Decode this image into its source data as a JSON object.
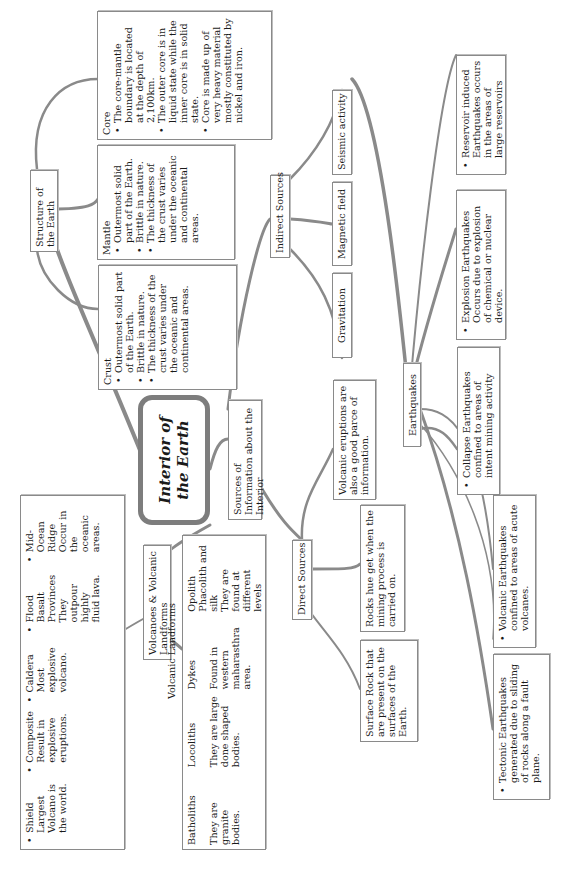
{
  "title": "Interior of the Earth",
  "structure": {
    "label": "Structure of the Earth",
    "crust": {
      "heading": "Crust",
      "points": [
        "Outermost solid part of the Earth.",
        "Brittle in nature.",
        "The thickness of the crust varies under the oceanic and continental areas."
      ]
    },
    "mantle": {
      "heading": "Mantle",
      "points": [
        "Outermost solid part of the Earth.",
        "Brittle in nature.",
        "The thickness of the crust varies under the oceanic and continental areas."
      ]
    },
    "core": {
      "heading": "Core",
      "points": [
        "The core-mantle boundary is located at the depth of 2,100km.",
        "The outer core is in liquid state while the inner core is in solid state.",
        "Core is made up of very heavy material mostly constituted by nickel and iron."
      ]
    }
  },
  "sources": {
    "label": "Sources of Information about the Interior",
    "indirect": {
      "label": "Indirect Sources",
      "items": [
        "Gravitation",
        "Magnetic field",
        "Seismic activity"
      ]
    },
    "direct": {
      "label": "Direct Sources",
      "items": [
        "Surface Rock that are present on the surfaces of the Earth.",
        "Rocks hue get when the mining process is carried on.",
        "Volcanic eruptions are also a good parce of information."
      ]
    }
  },
  "earthquakes": {
    "label": "Earthquakes",
    "types": [
      "Tectonic Earthquakes generated due to sliding of rocks along a fault plane.",
      "Volcanic Earthquakes confined to areas of acute volcanes.",
      "Collapse Earthquakes confined to areas of intent mining activity",
      "Explosion Earthquakes Occurs due to explosion of chemical or nuclear device.",
      "Reservoir induced Earthquakes occurs in the areas of large reservoirs"
    ]
  },
  "volcanoes": {
    "label": "Volcanoes & Volcanic Landforms",
    "types_label": "Types of Volcanes",
    "landforms_label": "Volcanic Landforms",
    "types": [
      {
        "name": "Shield",
        "desc": "Largest Volcano is the world."
      },
      {
        "name": "Composite",
        "desc": "Result in explosive eruptions."
      },
      {
        "name": "Caldera",
        "desc": "Most explosive volcano."
      },
      {
        "name": "Flood Basalt Provinces",
        "desc": "They outpour highly fluid lava."
      },
      {
        "name": "Mid-Ocean Ridge",
        "desc": "Occur in the oceanic areas."
      }
    ],
    "landforms": [
      {
        "name": "Batholiths",
        "desc": "They are granite bodies."
      },
      {
        "name": "Locoliths",
        "desc": "They are large done shaped bodies."
      },
      {
        "name": "Dykes",
        "desc": "Found in western maharasthra area."
      },
      {
        "name": "Opolith Phacolith and silk",
        "desc": "They are found at different levels"
      }
    ]
  },
  "colors": {
    "stroke": "#8a8a8a",
    "border": "#8a8a8a",
    "text": "#1a1a1a",
    "background": "#ffffff"
  }
}
